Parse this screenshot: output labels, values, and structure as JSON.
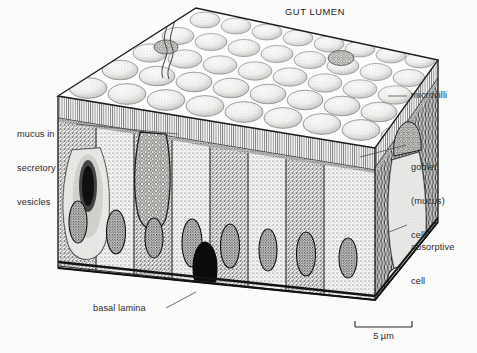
{
  "figure": {
    "title": "GUT LUMEN",
    "background_color": "#fbfbfa",
    "ink_color": "#1c1c1c",
    "label_color": "#2b2b2b"
  },
  "labels": {
    "gut_lumen": "GUT LUMEN",
    "mucus_in_secretory_vesicles": [
      "mucus in",
      "secretory",
      "vesicles"
    ],
    "microvilli": "microvilli",
    "goblet_mucus_cell": [
      "goblet",
      "(mucus)",
      "cell"
    ],
    "absorptive_cell": [
      "absorptive",
      "cell"
    ],
    "basal_lamina": "basal lamina"
  },
  "scale_bar": {
    "value": "5",
    "unit": "µm",
    "text": "5 µm",
    "length_px": 57
  }
}
